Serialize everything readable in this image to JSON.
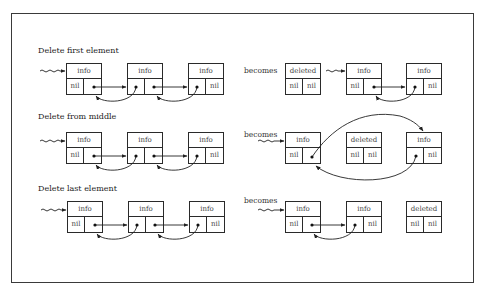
{
  "figure": {
    "rows": [
      {
        "title": "Delete first element",
        "becomes_label": "becomes",
        "before": [
          {
            "info": "info",
            "prev": "nil",
            "next": ""
          },
          {
            "info": "info",
            "prev": "",
            "next": ""
          },
          {
            "info": "info",
            "prev": "",
            "next": "nil"
          }
        ],
        "after": [
          {
            "info": "deleted",
            "prev": "nil",
            "next": "nil"
          },
          {
            "info": "info",
            "prev": "nil",
            "next": ""
          },
          {
            "info": "info",
            "prev": "",
            "next": "nil"
          }
        ]
      },
      {
        "title": "Delete from middle",
        "becomes_label": "becomes",
        "before": [
          {
            "info": "info",
            "prev": "nil",
            "next": ""
          },
          {
            "info": "info",
            "prev": "",
            "next": ""
          },
          {
            "info": "info",
            "prev": "",
            "next": "nil"
          }
        ],
        "after": [
          {
            "info": "info",
            "prev": "nil",
            "next": ""
          },
          {
            "info": "deleted",
            "prev": "nil",
            "next": "nil"
          },
          {
            "info": "info",
            "prev": "",
            "next": "nil"
          }
        ]
      },
      {
        "title": "Delete last element",
        "becomes_label": "becomes",
        "before": [
          {
            "info": "info",
            "prev": "nil",
            "next": ""
          },
          {
            "info": "info",
            "prev": "",
            "next": ""
          },
          {
            "info": "info",
            "prev": "",
            "next": "nil"
          }
        ],
        "after": [
          {
            "info": "info",
            "prev": "nil",
            "next": ""
          },
          {
            "info": "info",
            "prev": "",
            "next": "nil"
          },
          {
            "info": "deleted",
            "prev": "nil",
            "next": "nil"
          }
        ]
      }
    ]
  }
}
